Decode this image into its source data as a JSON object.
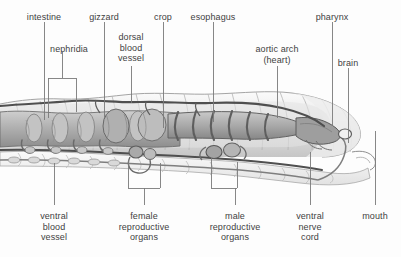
{
  "figure": {
    "background_color": "#fdfdfd",
    "label_color": "#3f3f3f",
    "leader_color": "#6b6b6b",
    "body_fill_light": "#f2f2f2",
    "body_fill_mid": "#d8d8d8",
    "organ_fill": "#b9b9b9",
    "organ_dark": "#8a8a8a",
    "outline_color": "#555555"
  },
  "labels": {
    "top": [
      {
        "id": "intestine",
        "text": "intestine",
        "x": 44,
        "y": 12
      },
      {
        "id": "nephridia",
        "text": "nephridia",
        "x": 69,
        "y": 44
      },
      {
        "id": "gizzard",
        "text": "gizzard",
        "x": 104,
        "y": 12
      },
      {
        "id": "dorsal-blood-vessel",
        "text": "dorsal\nblood\nvessel",
        "x": 131,
        "y": 32
      },
      {
        "id": "crop",
        "text": "crop",
        "x": 163,
        "y": 12
      },
      {
        "id": "esophagus",
        "text": "esophagus",
        "x": 213,
        "y": 12
      },
      {
        "id": "aortic-arch",
        "text": "aortic arch\n(heart)",
        "x": 277,
        "y": 44
      },
      {
        "id": "pharynx",
        "text": "pharynx",
        "x": 332,
        "y": 12
      },
      {
        "id": "brain",
        "text": "brain",
        "x": 348,
        "y": 58
      }
    ],
    "bottom": [
      {
        "id": "ventral-blood-vessel",
        "text": "ventral\nblood\nvessel",
        "x": 54,
        "y": 211
      },
      {
        "id": "female-reproductive",
        "text": "female\nreproductive\norgans",
        "x": 144,
        "y": 211
      },
      {
        "id": "male-reproductive",
        "text": "male\nreproductive\norgans",
        "x": 235,
        "y": 211
      },
      {
        "id": "ventral-nerve-cord",
        "text": "ventral\nnerve\ncord",
        "x": 310,
        "y": 211
      },
      {
        "id": "mouth",
        "text": "mouth",
        "x": 375,
        "y": 211
      }
    ]
  },
  "leaders": {
    "description": "thin vertical pointer lines and square brackets joining labels to structures",
    "lines": [
      {
        "id": "leader-intestine",
        "x1": 44,
        "y1": 22,
        "x2": 44,
        "y2": 120
      },
      {
        "id": "leader-gizzard",
        "x1": 104,
        "y1": 22,
        "x2": 104,
        "y2": 118
      },
      {
        "id": "leader-crop",
        "x1": 163,
        "y1": 22,
        "x2": 163,
        "y2": 128
      },
      {
        "id": "leader-esophagus",
        "x1": 213,
        "y1": 22,
        "x2": 213,
        "y2": 122
      },
      {
        "id": "leader-pharynx",
        "x1": 332,
        "y1": 22,
        "x2": 332,
        "y2": 126
      },
      {
        "id": "leader-aortic-arch",
        "x1": 277,
        "y1": 66,
        "x2": 277,
        "y2": 118
      },
      {
        "id": "leader-brain",
        "x1": 348,
        "y1": 68,
        "x2": 348,
        "y2": 143
      },
      {
        "id": "leader-dorsal-blood-vessel",
        "x1": 131,
        "y1": 66,
        "x2": 131,
        "y2": 103
      },
      {
        "id": "leader-ventral-blood-vessel",
        "x1": 54,
        "y1": 163,
        "x2": 54,
        "y2": 205
      },
      {
        "id": "leader-ventral-nerve-cord",
        "x1": 310,
        "y1": 152,
        "x2": 310,
        "y2": 205
      },
      {
        "id": "leader-mouth",
        "x1": 375,
        "y1": 131,
        "x2": 375,
        "y2": 205
      }
    ],
    "brackets": [
      {
        "id": "bracket-nephridia",
        "orientation": "down",
        "x_left": 48,
        "x_right": 76,
        "y_bar": 78,
        "y_tip": 118,
        "stem_x": 62,
        "stem_to": 68
      },
      {
        "id": "bracket-female-reproductive",
        "orientation": "up",
        "x_left": 128,
        "x_right": 160,
        "y_bar": 188,
        "y_tip": 160,
        "stem_x": 144,
        "stem_to": 205
      },
      {
        "id": "bracket-male-reproductive",
        "orientation": "up",
        "x_left": 211,
        "x_right": 237,
        "y_bar": 188,
        "y_tip": 158,
        "stem_x": 235,
        "stem_to": 205
      }
    ]
  },
  "structures": [
    {
      "id": "body-wall",
      "name": "segmented body wall",
      "note": "annulated cuticle, anterior tapering to mouth at right"
    },
    {
      "id": "intestine",
      "name": "intestine",
      "note": "wide chambered tube in posterior half"
    },
    {
      "id": "nephridia",
      "name": "nephridia",
      "note": "paired coiled excretory tubules, one pair per segment"
    },
    {
      "id": "gizzard",
      "name": "gizzard",
      "note": "muscular grinding chamber"
    },
    {
      "id": "crop",
      "name": "crop",
      "note": "storage sac anterior to gizzard"
    },
    {
      "id": "esophagus",
      "name": "esophagus",
      "note": "narrow ribbed tube"
    },
    {
      "id": "pharynx",
      "name": "pharynx",
      "note": "muscular bulb behind mouth"
    },
    {
      "id": "dorsal-blood-vessel",
      "name": "dorsal blood vessel",
      "note": "runs along top of gut"
    },
    {
      "id": "ventral-blood-vessel",
      "name": "ventral blood vessel",
      "note": "runs along bottom of gut"
    },
    {
      "id": "aortic-arches",
      "name": "aortic arches (hearts)",
      "note": "five paired vessels encircling esophagus"
    },
    {
      "id": "brain",
      "name": "brain",
      "note": "cerebral ganglion above pharynx"
    },
    {
      "id": "ventral-nerve-cord",
      "name": "ventral nerve cord",
      "note": "runs along ventral floor"
    },
    {
      "id": "female-reproductive",
      "name": "female reproductive organs",
      "note": "ovaries and seminal receptacles"
    },
    {
      "id": "male-reproductive",
      "name": "male reproductive organs",
      "note": "testes and seminal vesicles"
    },
    {
      "id": "mouth",
      "name": "mouth",
      "note": "anterior opening beneath prostomium"
    }
  ]
}
